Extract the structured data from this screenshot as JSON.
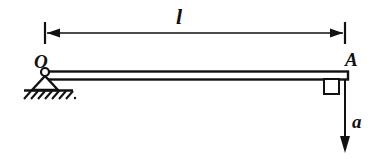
{
  "figure": {
    "background_color": "#ffffff",
    "line_color": "#111111",
    "width": 388,
    "height": 165
  },
  "labels": {
    "length_dimension": "l",
    "pivot_point": "O",
    "end_point": "A",
    "acceleration": "a"
  },
  "elements": {
    "dimension_line": {
      "name": "length-dimension-l",
      "y": 33,
      "x_start": 45,
      "x_end": 345,
      "arrowheads": "both",
      "extension_tick_height": 22
    },
    "beam": {
      "name": "rigid-beam-OA",
      "x_start": 45,
      "x_end": 348,
      "top_y": 72,
      "bottom_y": 79,
      "style": "double-line-rectangle"
    },
    "pin_support": {
      "name": "pin-support-triangle",
      "pin_center_x": 45,
      "pin_center_y": 72,
      "pin_radius": 3.5,
      "triangle_half_width": 13,
      "base_y": 90
    },
    "ground": {
      "name": "ground-hatching",
      "line_y": 90,
      "x_start": 24,
      "x_end": 73,
      "hatch_count": 7,
      "hatch_angle": "45deg"
    },
    "right_angle_marker": {
      "name": "right-angle-marker",
      "x": 324,
      "y": 79,
      "size": 14
    },
    "force_arrow": {
      "name": "acceleration-arrow-a",
      "x": 345,
      "y_start": 79,
      "y_end": 152,
      "direction": "down"
    }
  }
}
